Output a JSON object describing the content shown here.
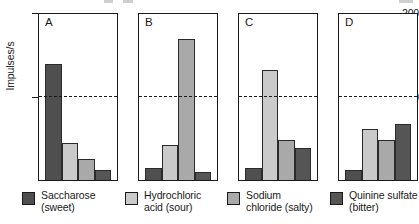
{
  "chart_data": {
    "type": "bar",
    "title": "",
    "subtitle": "",
    "xlabel": "",
    "ylabel": "Impulses/s",
    "ylim": [
      0,
      200
    ],
    "ytick_labels": [
      "200",
      "100"
    ],
    "ytick_values": [
      200,
      100
    ],
    "grid": false,
    "legend_position": "bottom",
    "annotations": [
      {
        "label": "reference line",
        "value": 100,
        "style": "dashed-horizontal"
      }
    ],
    "categories": [
      "Saccharose (sweet)",
      "Hydrochloric acid (sour)",
      "Sodium chloride (salty)",
      "Quinine sulfate (bitter)"
    ],
    "panels": [
      {
        "letter": "A",
        "name": "panel-a",
        "best_stimulus": "Saccharose (sweet)",
        "values": [
          140,
          45,
          25,
          12
        ]
      },
      {
        "letter": "B",
        "name": "panel-b",
        "best_stimulus": "Hydrochloric acid (sour)",
        "values": [
          15,
          42,
          170,
          10
        ]
      },
      {
        "letter": "C",
        "name": "panel-c",
        "best_stimulus": "Sodium chloride (salty)",
        "values": [
          15,
          133,
          48,
          38
        ]
      },
      {
        "letter": "D",
        "name": "panel-d",
        "best_stimulus": "Quinine sulfate (bitter)",
        "values": [
          12,
          62,
          48,
          67
        ]
      }
    ],
    "series": [
      {
        "name": "Saccharose (sweet)",
        "values": [
          140,
          15,
          15,
          12
        ],
        "color": "#4f4f4f"
      },
      {
        "name": "Hydrochloric acid (sour)",
        "values": [
          45,
          42,
          133,
          62
        ],
        "color": "#cacaca"
      },
      {
        "name": "Sodium chloride (salty)",
        "values": [
          25,
          170,
          48,
          48
        ],
        "color": "#a9a9a9"
      },
      {
        "name": "Quinine sulfate (bitter)",
        "values": [
          12,
          10,
          38,
          67
        ],
        "color": "#555555"
      }
    ]
  },
  "legend": {
    "items": [
      {
        "label": "Saccharose\n(sweet)",
        "color": "#4f4f4f",
        "icon": "legend-swatch-saccharose"
      },
      {
        "label": "Hydrochloric\nacid (sour)",
        "color": "#cacaca",
        "icon": "legend-swatch-hydrochloric-acid"
      },
      {
        "label": "Sodium\nchloride (salty)",
        "color": "#a9a9a9",
        "icon": "legend-swatch-sodium-chloride"
      },
      {
        "label": "Quinine sulfate\n(bitter)",
        "color": "#555555",
        "icon": "legend-swatch-quinine-sulfate"
      }
    ]
  },
  "colors": {
    "bar_dark": "#4f4f4f",
    "bar_light": "#cacaca",
    "bar_medium": "#a9a9a9",
    "bar_darker": "#555555",
    "axis": "#1a1a1a",
    "background": "#ffffff"
  }
}
